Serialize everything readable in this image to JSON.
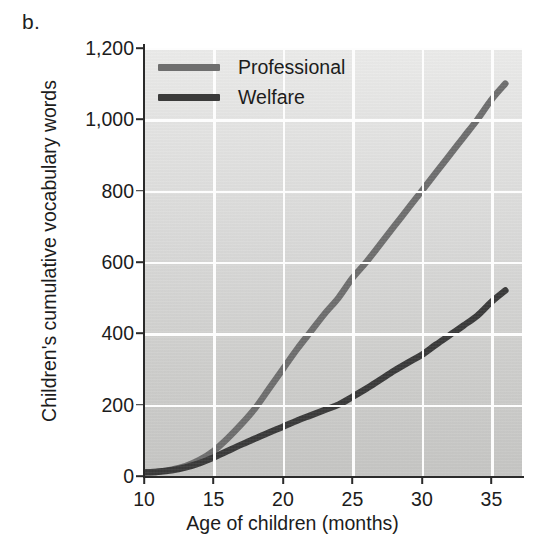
{
  "figure": {
    "panel_label": "b."
  },
  "legend": {
    "position": "top-left-inside",
    "entries": [
      {
        "label": "Professional",
        "color": "#6e6e6e"
      },
      {
        "label": "Welfare",
        "color": "#3a3a3a"
      }
    ]
  },
  "axes": {
    "y": {
      "title": "Children's cumulative vocabulary words",
      "ticks": [
        0,
        200,
        400,
        600,
        800,
        1000,
        1200
      ],
      "tick_labels": [
        "0",
        "200",
        "400",
        "600",
        "800",
        "1,000",
        "1,200"
      ],
      "min": 0,
      "max": 1200
    },
    "x": {
      "title": "Age of children (months)",
      "ticks": [
        10,
        15,
        20,
        25,
        30,
        35
      ],
      "tick_labels": [
        "10",
        "15",
        "20",
        "25",
        "30",
        "35"
      ],
      "min": 10,
      "max": 37.2
    }
  },
  "style": {
    "plot_background_top": "#ececeb",
    "plot_background_bottom": "#c6c6c4",
    "gridline_color": "#fdfdfd",
    "axis_color": "#2a2a2a",
    "text_color": "#1c1c1c"
  },
  "chart_data": {
    "type": "line",
    "title": "",
    "subtitle": "",
    "xlabel": "Age of children (months)",
    "ylabel": "Children's cumulative vocabulary words",
    "xlim": [
      10,
      37.2
    ],
    "ylim": [
      0,
      1200
    ],
    "grid": true,
    "legend_position": "upper left",
    "annotations": [
      "b."
    ],
    "x": [
      10,
      11,
      12,
      13,
      14,
      15,
      16,
      17,
      18,
      19,
      20,
      21,
      22,
      23,
      24,
      25,
      26,
      27,
      28,
      29,
      30,
      31,
      32,
      33,
      34,
      35,
      36
    ],
    "series": [
      {
        "name": "Professional",
        "color": "#6e6e6e",
        "values": [
          10,
          12,
          18,
          28,
          45,
          70,
          105,
          145,
          190,
          245,
          300,
          355,
          405,
          455,
          500,
          555,
          600,
          650,
          700,
          750,
          800,
          850,
          900,
          950,
          1000,
          1055,
          1100
        ]
      },
      {
        "name": "Welfare",
        "color": "#3a3a3a",
        "values": [
          10,
          12,
          16,
          24,
          36,
          52,
          70,
          88,
          105,
          122,
          138,
          155,
          170,
          185,
          200,
          222,
          245,
          270,
          295,
          318,
          340,
          368,
          395,
          422,
          450,
          488,
          520
        ]
      }
    ]
  }
}
